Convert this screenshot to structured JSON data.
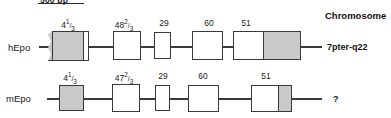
{
  "figure": {
    "scale_bar": {
      "label": "500 bp"
    },
    "right_column": {
      "header": "Chromosome"
    },
    "rows": [
      {
        "name": "hEpo",
        "label": "hEpo",
        "chromosome": "7pter-q22",
        "exons": [
          {
            "label_whole": "4",
            "label_num": "1",
            "label_den": "3",
            "fill": "grey"
          },
          {
            "label_whole": "48",
            "label_num": "2",
            "label_den": "3",
            "fill": "white"
          },
          {
            "label_whole": "29",
            "label_num": "",
            "label_den": "",
            "fill": "white"
          },
          {
            "label_whole": "60",
            "label_num": "",
            "label_den": "",
            "fill": "white"
          },
          {
            "label_whole": "51",
            "label_num": "",
            "label_den": "",
            "fill": "white-grey"
          }
        ]
      },
      {
        "name": "mEpo",
        "label": "mEpo",
        "chromosome": "?",
        "exons": [
          {
            "label_whole": "4",
            "label_num": "1",
            "label_den": "3",
            "fill": "grey"
          },
          {
            "label_whole": "47",
            "label_num": "2",
            "label_den": "3",
            "fill": "white"
          },
          {
            "label_whole": "29",
            "label_num": "",
            "label_den": "",
            "fill": "white"
          },
          {
            "label_whole": "60",
            "label_num": "",
            "label_den": "",
            "fill": "white"
          },
          {
            "label_whole": "51",
            "label_num": "",
            "label_den": "",
            "fill": "white-grey"
          }
        ]
      }
    ]
  }
}
